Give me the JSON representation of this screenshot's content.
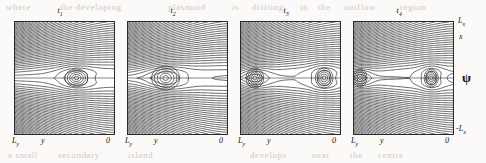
{
  "figure": {
    "kind": "contour-plot-series",
    "background_color": "#fbfaf8",
    "contour_color": "#333333",
    "frame_color": "#2a2a2a"
  },
  "quantity_label": "ψ",
  "axes": {
    "x_axis_label": "y",
    "x_left_tick": "L",
    "x_left_tick_sub": "y",
    "x_right_tick": "0",
    "y_axis_label": "x",
    "y_top_tick": "L",
    "y_top_tick_sub": "x",
    "y_bottom_tick": "-L",
    "y_bottom_tick_sub": "x"
  },
  "panels": [
    {
      "title": "t",
      "title_sub": "1",
      "left": 14,
      "width": 99
    },
    {
      "title": "t",
      "title_sub": "2",
      "left": 127,
      "width": 99
    },
    {
      "title": "t",
      "title_sub": "3",
      "left": 240,
      "width": 99
    },
    {
      "title": "t",
      "title_sub": "4",
      "left": 353,
      "width": 99
    }
  ],
  "bleed_text": [
    {
      "text": "where",
      "left": 6,
      "top": 2
    },
    {
      "text": "the developing",
      "left": 60,
      "top": 2
    },
    {
      "text": "plasmoid",
      "left": 168,
      "top": 2
    },
    {
      "text": "is",
      "left": 232,
      "top": 2
    },
    {
      "text": "drifting",
      "left": 252,
      "top": 2
    },
    {
      "text": "in",
      "left": 300,
      "top": 2
    },
    {
      "text": "the",
      "left": 318,
      "top": 2
    },
    {
      "text": "outflow",
      "left": 344,
      "top": 2
    },
    {
      "text": "region",
      "left": 400,
      "top": 2
    },
    {
      "text": "a small",
      "left": 8,
      "top": 150
    },
    {
      "text": "secondary",
      "left": 58,
      "top": 150
    },
    {
      "text": "island",
      "left": 128,
      "top": 150
    },
    {
      "text": "develops",
      "left": 250,
      "top": 150
    },
    {
      "text": "near",
      "left": 312,
      "top": 150
    },
    {
      "text": "the",
      "left": 350,
      "top": 150
    },
    {
      "text": "centre",
      "left": 378,
      "top": 150
    }
  ],
  "chart_data": {
    "type": "line",
    "title": "",
    "subplots": 4,
    "shared_quantity": "ψ",
    "xlabel": "y",
    "ylabel": "x",
    "xlim": [
      "L_y",
      "0"
    ],
    "ylim": [
      "-L_x",
      "L_x"
    ],
    "grid": false,
    "legend": "none",
    "series": [
      {
        "name": "t1",
        "description": "Contours of psi: X-line reconnection with a single magnetic island (plasmoid) centred right of mid-panel",
        "island_centers_normalized": [
          [
            0.62,
            0.5
          ]
        ],
        "island_half_width_x": 0.13,
        "island_half_height_y": 0.09,
        "x_point_positions_normalized": [
          [
            0.3,
            0.5
          ],
          [
            0.92,
            0.5
          ]
        ],
        "contour_count": 42
      },
      {
        "name": "t2",
        "description": "Island has grown and migrated left toward the inflow side; elongated outflow jet to the right",
        "island_centers_normalized": [
          [
            0.38,
            0.5
          ]
        ],
        "island_half_width_x": 0.16,
        "island_half_height_y": 0.12,
        "x_point_positions_normalized": [
          [
            0.18,
            0.5
          ],
          [
            0.62,
            0.5
          ]
        ],
        "contour_count": 42
      },
      {
        "name": "t3",
        "description": "Island reaches the left boundary region; a thin elongated current sheet extends across the panel with a small secondary island forming near the right",
        "island_centers_normalized": [
          [
            0.14,
            0.5
          ],
          [
            0.84,
            0.5
          ]
        ],
        "island_half_width_x": 0.1,
        "island_half_height_y": 0.1,
        "x_point_positions_normalized": [
          [
            0.34,
            0.5
          ],
          [
            0.74,
            0.5
          ]
        ],
        "contour_count": 42
      },
      {
        "name": "t4",
        "description": "Primary island pinned at the left edge, a spiral/curl structure forms at the X-point, and a secondary island sits in the right half of the sheet",
        "island_centers_normalized": [
          [
            0.06,
            0.5
          ],
          [
            0.78,
            0.5
          ]
        ],
        "island_half_width_x": 0.08,
        "island_half_height_y": 0.09,
        "x_point_positions_normalized": [
          [
            0.26,
            0.5
          ],
          [
            0.62,
            0.5
          ]
        ],
        "contour_count": 42
      }
    ]
  }
}
